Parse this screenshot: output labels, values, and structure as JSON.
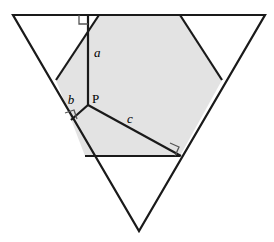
{
  "figure": {
    "kind": "geometry-diagram",
    "width": 274,
    "height": 242,
    "background_color": "#ffffff",
    "shaded_fill_color": "#e3e3e3",
    "stroke_color": "#1a1a1a",
    "outer_triangle": {
      "name": "outer-inverted-triangle",
      "vertices": [
        [
          13,
          15
        ],
        [
          265,
          15
        ],
        [
          139,
          231
        ]
      ],
      "fill": "#ffffff"
    },
    "white_corner_triangles": [
      {
        "name": "white-triangle-top-left",
        "vertices": [
          [
            13,
            15
          ],
          [
            99,
            15
          ],
          [
            56,
            80
          ]
        ],
        "fill": "#ffffff"
      },
      {
        "name": "white-triangle-top-right",
        "vertices": [
          [
            180,
            15
          ],
          [
            265,
            15
          ],
          [
            222,
            80
          ]
        ],
        "fill": "#ffffff"
      },
      {
        "name": "white-triangle-bottom",
        "vertices": [
          [
            85,
            156
          ],
          [
            180,
            156
          ],
          [
            139,
            231
          ]
        ],
        "fill": "#ffffff"
      }
    ],
    "shaded_hexagon": {
      "name": "shaded-hexagon",
      "vertices": [
        [
          99,
          15
        ],
        [
          180,
          15
        ],
        [
          222,
          80
        ],
        [
          180,
          156
        ],
        [
          85,
          156
        ],
        [
          56,
          80
        ]
      ],
      "fill": "#e3e3e3"
    },
    "point_p": {
      "name": "point-p",
      "x": 88,
      "y": 105,
      "label": "P",
      "label_x": 93,
      "label_y": 103
    },
    "segments": [
      {
        "name": "segment-a",
        "label": "a",
        "from": [
          88,
          105
        ],
        "to": [
          88,
          18
        ],
        "label_x": 94,
        "label_y": 57,
        "perpendicular_to": "top-side"
      },
      {
        "name": "segment-b",
        "label": "b",
        "from": [
          88,
          105
        ],
        "to": [
          72,
          119
        ],
        "label_x": 74,
        "label_y": 102,
        "perpendicular_to": "left-side"
      },
      {
        "name": "segment-c",
        "label": "c",
        "from": [
          88,
          105
        ],
        "to": [
          180,
          156
        ],
        "label_x": 130,
        "label_y": 122,
        "perpendicular_to": "right-side"
      }
    ],
    "right_angle_marks": [
      {
        "name": "right-angle-mark-a",
        "at": [
          88,
          18
        ],
        "size": 9
      },
      {
        "name": "right-angle-mark-b",
        "at": [
          72,
          119
        ],
        "size": 9
      },
      {
        "name": "right-angle-mark-c",
        "at": [
          180,
          156
        ],
        "size": 9
      }
    ],
    "labels": {
      "a": "a",
      "b": "b",
      "c": "c",
      "p": "P"
    }
  }
}
